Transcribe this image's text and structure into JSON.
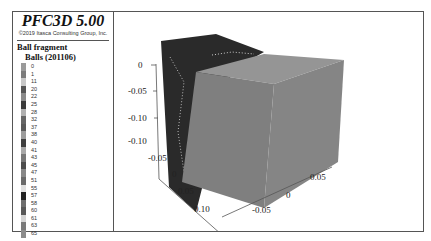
{
  "header": {
    "title": "PFC3D 5.00",
    "copyright": "©2019 Itasca Consulting Group, Inc."
  },
  "legend": {
    "heading": "Ball fragment",
    "subheading": "Balls (201106)",
    "items": [
      {
        "label": "0",
        "color": "#9a9a9a"
      },
      {
        "label": "1",
        "color": "#7c7c7c"
      },
      {
        "label": "11",
        "color": "#c8c8c8"
      },
      {
        "label": "20",
        "color": "#555555"
      },
      {
        "label": "22",
        "color": "#8a8a8a"
      },
      {
        "label": "25",
        "color": "#3a3a3a"
      },
      {
        "label": "28",
        "color": "#b0b0b0"
      },
      {
        "label": "32",
        "color": "#666666"
      },
      {
        "label": "37",
        "color": "#5a5a5a"
      },
      {
        "label": "38",
        "color": "#9c9c9c"
      },
      {
        "label": "40",
        "color": "#3f3f3f"
      },
      {
        "label": "41",
        "color": "#a8a8a8"
      },
      {
        "label": "43",
        "color": "#777777"
      },
      {
        "label": "45",
        "color": "#4c4c4c"
      },
      {
        "label": "47",
        "color": "#888888"
      },
      {
        "label": "51",
        "color": "#6a6a6a"
      },
      {
        "label": "55",
        "color": "#e0e0e0"
      },
      {
        "label": "57",
        "color": "#222222"
      },
      {
        "label": "58",
        "color": "#6e6e6e"
      },
      {
        "label": "60",
        "color": "#585858"
      },
      {
        "label": "61",
        "color": "#d4d4d4"
      },
      {
        "label": "63",
        "color": "#7a7a7a"
      },
      {
        "label": "65",
        "color": "#8c8c8c"
      }
    ]
  },
  "plot": {
    "z_axis_ticks": [
      "0",
      "-0.05",
      "-0.10"
    ],
    "y_axis_ticks": [
      "-0.10",
      "-0.05",
      "0",
      "0.05",
      "0.10"
    ],
    "x_axis_ticks": [
      "-0.05",
      "0",
      "0.05"
    ],
    "colors": {
      "dark_block": "#2a2a2a",
      "light_block_front": "#808080",
      "light_block_top": "#909090",
      "axis": "#555555"
    }
  }
}
